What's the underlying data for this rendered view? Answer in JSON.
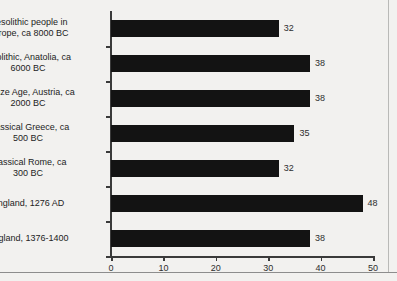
{
  "chart_data": {
    "type": "bar",
    "orientation": "horizontal",
    "title": "",
    "subtitle": "",
    "xlabel": "",
    "ylabel": "",
    "xlim": [
      0,
      50
    ],
    "xticks": [
      0,
      10,
      20,
      30,
      40,
      50
    ],
    "xtick_labels": [
      "0",
      "10",
      "20",
      "30",
      "40",
      "50"
    ],
    "grid": false,
    "legend": false,
    "bar_color": "#131313",
    "background_color": "#f2f1ef",
    "axis_color": "#3a3a3a",
    "show_value_labels": true,
    "categories": [
      "Mesolithic people in\nEurope, ca 8000 BC",
      "Neolithic, Anatolia, ca\n6000 BC",
      "Bronze Age, Austria, ca\n2000 BC",
      "Classical Greece, ca\n500 BC",
      "Classical Rome, ca\n300 BC",
      "England, 1276 AD",
      "England, 1376-1400"
    ],
    "values": [
      32,
      38,
      38,
      35,
      32,
      48,
      38
    ],
    "value_labels": [
      "32",
      "38",
      "38",
      "35",
      "32",
      "48",
      "38"
    ]
  }
}
